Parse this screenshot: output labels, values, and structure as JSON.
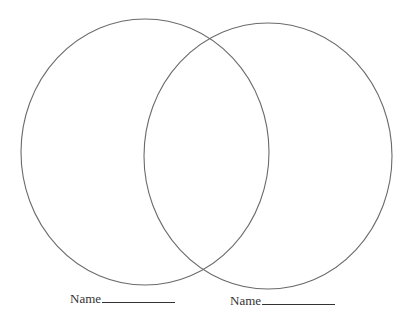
{
  "diagram": {
    "type": "venn",
    "stroke_color": "#6b6b6b",
    "circles": [
      {
        "id": "left",
        "cx": 145,
        "cy": 152,
        "rx": 124,
        "ry": 133
      },
      {
        "id": "right",
        "cx": 268,
        "cy": 156,
        "rx": 124,
        "ry": 133
      }
    ],
    "labels": [
      {
        "text": "Name",
        "blank": "__________"
      },
      {
        "text": "Name",
        "blank": "__________"
      }
    ]
  }
}
